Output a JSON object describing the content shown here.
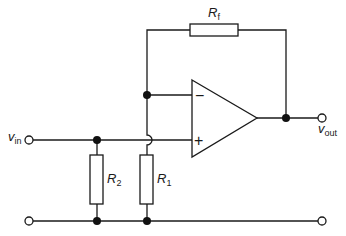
{
  "diagram": {
    "type": "circuit-schematic",
    "colors": {
      "line": "#1a1a1a",
      "background": "#ffffff"
    },
    "components": {
      "feedback_resistor": {
        "symbol": "R",
        "subscript": "f"
      },
      "input_resistor_r2": {
        "symbol": "R",
        "subscript": "2"
      },
      "ground_resistor_r1": {
        "symbol": "R",
        "subscript": "1"
      },
      "opamp": {
        "inverting_sign": "−",
        "noninverting_sign": "+"
      }
    },
    "terminals": {
      "input": {
        "symbol": "v",
        "subscript": "in"
      },
      "output": {
        "symbol": "v",
        "subscript": "out"
      }
    }
  }
}
